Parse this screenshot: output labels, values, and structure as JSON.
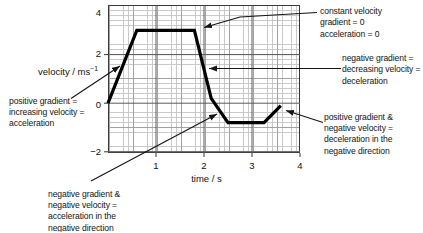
{
  "figure": {
    "xlabel": "time / s",
    "ylabel_base": "velocity / ms",
    "ylabel_sup": "−1",
    "xticks": [
      "1",
      "2",
      "3",
      "4"
    ],
    "yticks": [
      "4",
      "2",
      "0",
      "−2"
    ],
    "grid": {
      "major_x": [
        1,
        2,
        3
      ],
      "major_y": [
        2,
        0,
        -2
      ],
      "xtick_marks": [
        1,
        2,
        3,
        4
      ],
      "ytick_marks": [
        2,
        0,
        -2
      ]
    }
  },
  "annotations": [
    {
      "id": "constant-velocity",
      "lines": [
        "constant velocity",
        "gradient = 0",
        "acceleration = 0"
      ],
      "leader": [
        [
          317,
          12.5
        ],
        [
          240,
          17
        ],
        [
          204,
          27.5
        ]
      ]
    },
    {
      "id": "deceleration",
      "lines": [
        "negative gradient =",
        "decreasing velocity =",
        "deceleration"
      ],
      "leader": [
        [
          341,
          68.5
        ],
        [
          209,
          68.5
        ]
      ]
    },
    {
      "id": "acceleration",
      "lines": [
        "positive gradient =",
        "increasing velocity =",
        "acceleration"
      ],
      "leader": [
        [
          71,
          98.5
        ],
        [
          120,
          66
        ]
      ]
    },
    {
      "id": "acceleration-negative-direction",
      "lines": [
        "negative gradient &",
        "negative velocity =",
        "acceleration in the",
        "negative direction"
      ],
      "leader": [
        [
          91,
          181
        ],
        [
          217,
          114
        ]
      ]
    },
    {
      "id": "deceleration-negative-direction",
      "lines": [
        "positive gradient &",
        "negative velocity =",
        "deceleration in the",
        "negative direction"
      ],
      "leader": [
        [
          323,
          122.5
        ],
        [
          286,
          110.5
        ]
      ]
    }
  ],
  "chart_data": {
    "type": "line",
    "title": "",
    "xlabel": "time / s",
    "ylabel": "velocity / ms⁻¹",
    "xlim": [
      0,
      4
    ],
    "ylim": [
      -2.2,
      4.2
    ],
    "xticks": [
      1,
      2,
      3,
      4
    ],
    "yticks": [
      -2,
      0,
      2,
      4
    ],
    "grid": "fine graph paper, medium lines every 0.5 s / 1 ms-1, major lines every 1 s / 2 ms-1",
    "series": [
      {
        "name": "velocity",
        "points": [
          [
            0,
            0
          ],
          [
            0.6,
            3.0
          ],
          [
            1.8,
            3.0
          ],
          [
            2.15,
            0.2
          ],
          [
            2.5,
            -0.8
          ],
          [
            3.25,
            -0.8
          ],
          [
            3.6,
            -0.1
          ]
        ]
      }
    ],
    "annotations": [
      "constant velocity gradient = 0 acceleration = 0",
      "negative gradient = decreasing velocity = deceleration",
      "positive gradient = increasing velocity = acceleration",
      "negative gradient & negative velocity = acceleration in the negative direction",
      "positive gradient & negative velocity = deceleration in the negative direction"
    ],
    "colors": {
      "curve": "#000000",
      "grid_fine": "#c9c9c9",
      "grid_medium": "#a2a2a2",
      "grid_major": "#5a5a5a",
      "text": "#111111"
    }
  }
}
